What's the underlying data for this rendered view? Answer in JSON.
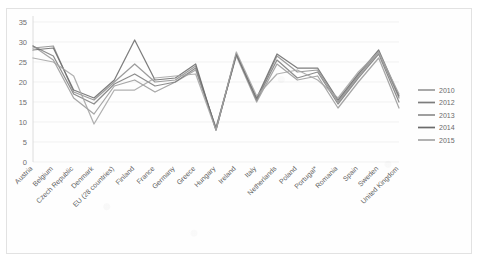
{
  "chart_data": {
    "type": "line",
    "title": "",
    "xlabel": "",
    "ylabel": "",
    "ylim": [
      0,
      35
    ],
    "y_ticks": [
      0,
      5,
      10,
      15,
      20,
      25,
      30,
      35
    ],
    "grid": true,
    "legend_position": "right",
    "categories": [
      "Austria",
      "Belgium",
      "Czech Republic",
      "Denmark",
      "EU (28 countries)",
      "Finland",
      "France",
      "Germany",
      "Greece",
      "Hungary",
      "Ireland",
      "Italy",
      "Netherlands",
      "Poland",
      "Portugal*",
      "Romania",
      "Spain",
      "Sweden",
      "United Kingdom"
    ],
    "series": [
      {
        "name": "2010",
        "color": "#9a9a9a",
        "values": [
          29.0,
          25.5,
          16.0,
          12.0,
          19.0,
          20.5,
          17.5,
          20.0,
          23.0,
          8.5,
          26.5,
          15.0,
          24.5,
          20.5,
          21.5,
          13.5,
          20.0,
          26.0,
          13.5
        ]
      },
      {
        "name": "2012",
        "color": "#7d7d7d",
        "values": [
          29.0,
          26.5,
          17.0,
          14.5,
          19.5,
          22.0,
          19.0,
          20.0,
          23.5,
          8.5,
          27.0,
          15.5,
          25.5,
          21.0,
          22.5,
          14.5,
          21.0,
          27.0,
          15.0
        ]
      },
      {
        "name": "2013",
        "color": "#8e8e8e",
        "values": [
          28.5,
          29.0,
          17.5,
          15.5,
          20.0,
          24.5,
          20.0,
          20.5,
          24.0,
          8.0,
          27.0,
          15.5,
          26.5,
          22.5,
          23.0,
          15.0,
          21.5,
          27.5,
          16.0
        ]
      },
      {
        "name": "2014",
        "color": "#6b6b6b",
        "values": [
          28.0,
          28.5,
          18.0,
          16.0,
          20.5,
          30.5,
          20.5,
          21.0,
          24.5,
          8.0,
          27.0,
          16.0,
          27.0,
          23.5,
          23.5,
          15.5,
          22.0,
          28.0,
          16.5
        ]
      },
      {
        "name": "2015",
        "color": "#a5a5a5",
        "values": [
          26.0,
          25.0,
          21.5,
          9.5,
          18.0,
          18.0,
          21.0,
          21.5,
          22.0,
          8.0,
          27.5,
          16.5,
          22.0,
          23.0,
          20.5,
          16.0,
          22.5,
          27.5,
          17.0
        ]
      }
    ]
  }
}
